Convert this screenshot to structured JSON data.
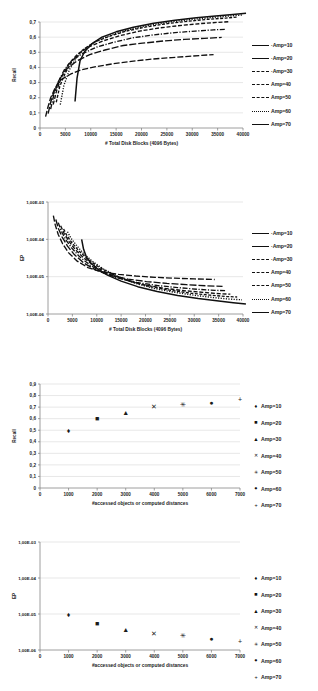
{
  "chart_data": [
    {
      "id": "recall-vs-blocks",
      "type": "line",
      "title": "",
      "xlabel": "# Total Disk Blocks (4096 Bytes)",
      "ylabel": "Recall",
      "xlim": [
        0,
        40000
      ],
      "ylim": [
        0,
        0.7
      ],
      "xticks": [
        0,
        5000,
        10000,
        15000,
        20000,
        25000,
        30000,
        35000,
        40000
      ],
      "xticklabels": [
        "0",
        "5000",
        "10000",
        "15000",
        "20000",
        "25000",
        "30000",
        "35000",
        "40000"
      ],
      "yticks": [
        0,
        0.1,
        0.2,
        0.3,
        0.4,
        0.5,
        0.6,
        0.7
      ],
      "yticklabels": [
        "0",
        "0,1",
        "0,2",
        "0,3",
        "0,4",
        "0,5",
        "0,6",
        "0,7"
      ],
      "grid": true,
      "legend_position": "right",
      "series": [
        {
          "name": "Amp=10",
          "dash": "6,2",
          "x": [
            1100,
            1500,
            2100,
            3000,
            4200,
            6000,
            8200,
            11000,
            14500,
            18000,
            22000,
            26000,
            30000,
            34200
          ],
          "y": [
            0.075,
            0.13,
            0.2,
            0.265,
            0.32,
            0.355,
            0.385,
            0.405,
            0.425,
            0.44,
            0.455,
            0.465,
            0.475,
            0.485
          ]
        },
        {
          "name": "Amp=20",
          "dash": "7,2",
          "x": [
            1600,
            2100,
            2900,
            4000,
            5400,
            7400,
            9800,
            12800,
            16400,
            20200,
            24400,
            28400,
            32400,
            35800
          ],
          "y": [
            0.095,
            0.17,
            0.255,
            0.33,
            0.395,
            0.445,
            0.485,
            0.515,
            0.545,
            0.56,
            0.575,
            0.585,
            0.592,
            0.598
          ]
        },
        {
          "name": "Amp=30",
          "dash": "5,1.6,1.2,1.6",
          "x": [
            2100,
            2700,
            3600,
            4800,
            6400,
            8600,
            11200,
            14400,
            18200,
            22400,
            26600,
            30600,
            34200,
            36600
          ],
          "y": [
            0.125,
            0.215,
            0.305,
            0.385,
            0.45,
            0.495,
            0.535,
            0.565,
            0.595,
            0.615,
            0.63,
            0.64,
            0.648,
            0.652
          ]
        },
        {
          "name": "Amp=40",
          "dash": "4,1.8",
          "x": [
            2600,
            3300,
            4300,
            5600,
            7300,
            9600,
            12400,
            15800,
            19600,
            23800,
            28000,
            31800,
            35200,
            37400
          ],
          "y": [
            0.155,
            0.25,
            0.34,
            0.42,
            0.485,
            0.535,
            0.575,
            0.61,
            0.64,
            0.662,
            0.678,
            0.69,
            0.698,
            0.702
          ]
        },
        {
          "name": "Amp=50",
          "dash": "3,1.5",
          "x": [
            3200,
            3900,
            5000,
            6400,
            8200,
            10600,
            13600,
            17000,
            21000,
            25200,
            29400,
            33200,
            36600,
            38800
          ],
          "y": [
            0.17,
            0.275,
            0.365,
            0.445,
            0.51,
            0.565,
            0.605,
            0.64,
            0.668,
            0.69,
            0.706,
            0.718,
            0.726,
            0.732
          ]
        },
        {
          "name": "Amp=60",
          "dash": "1.2,1.4",
          "x": [
            4000,
            4700,
            5800,
            7200,
            9000,
            11400,
            14400,
            17800,
            21800,
            26000,
            30200,
            34000,
            37400,
            39800
          ],
          "y": [
            0.155,
            0.28,
            0.385,
            0.465,
            0.53,
            0.58,
            0.62,
            0.652,
            0.68,
            0.702,
            0.718,
            0.73,
            0.74,
            0.746
          ]
        },
        {
          "name": "Amp=70",
          "dash": "none",
          "x": [
            6900,
            7300,
            7900,
            8800,
            10200,
            12200,
            15000,
            18400,
            22400,
            26600,
            30800,
            34600,
            38000,
            40600
          ],
          "y": [
            0.175,
            0.33,
            0.445,
            0.505,
            0.555,
            0.6,
            0.635,
            0.665,
            0.692,
            0.712,
            0.728,
            0.74,
            0.75,
            0.758
          ]
        }
      ]
    },
    {
      "id": "ep-vs-blocks",
      "type": "line",
      "title": "",
      "xlabel": "# Total Disk Blocks (4096 Bytes)",
      "ylabel": "EP",
      "xlim": [
        0,
        40000
      ],
      "ylim": [
        1e-06,
        0.001
      ],
      "yscale": "log",
      "xticks": [
        0,
        5000,
        10000,
        15000,
        20000,
        25000,
        30000,
        35000,
        40000
      ],
      "xticklabels": [
        "0",
        "5000",
        "10000",
        "15000",
        "20000",
        "25000",
        "30000",
        "35000",
        "40000"
      ],
      "yticks": [
        1e-06,
        1e-05,
        0.0001,
        0.001
      ],
      "yticklabels": [
        "1,00E-06",
        "1,00E-05",
        "1,00E-04",
        "1,00E-03"
      ],
      "grid": true,
      "legend_position": "right",
      "series": [
        {
          "name": "Amp=10",
          "dash": "6,2",
          "x": [
            1100,
            1500,
            2100,
            3000,
            4200,
            6000,
            8200,
            11000,
            14500,
            18000,
            22000,
            26000,
            30000,
            34200
          ],
          "y": [
            0.00043,
            0.00024,
            0.000135,
            7.6e-05,
            4.4e-05,
            2.6e-05,
            1.75e-05,
            1.35e-05,
            1.15e-05,
            1.04e-05,
            9.6e-06,
            9.1e-06,
            8.7e-06,
            8.4e-06
          ]
        },
        {
          "name": "Amp=20",
          "dash": "7,2",
          "x": [
            1600,
            2100,
            2900,
            4000,
            5400,
            7400,
            9800,
            12800,
            16400,
            20200,
            24400,
            28400,
            32400,
            35800
          ],
          "y": [
            0.00034,
            0.0002,
            0.000115,
            6.6e-05,
            3.9e-05,
            2.3e-05,
            1.5e-05,
            1.08e-05,
            8.6e-06,
            7.4e-06,
            6.6e-06,
            6.1e-06,
            5.7e-06,
            5.5e-06
          ]
        },
        {
          "name": "Amp=30",
          "dash": "5,1.6,1.2,1.6",
          "x": [
            2100,
            2700,
            3600,
            4800,
            6400,
            8600,
            11200,
            14400,
            18200,
            22400,
            26600,
            30600,
            34200,
            36600
          ],
          "y": [
            0.00028,
            0.00017,
            0.0001,
            6e-05,
            3.5e-05,
            2.05e-05,
            1.3e-05,
            9.1e-06,
            7e-06,
            5.8e-06,
            5.1e-06,
            4.6e-06,
            4.3e-06,
            4.2e-06
          ]
        },
        {
          "name": "Amp=40",
          "dash": "4,1.8",
          "x": [
            2600,
            3300,
            4300,
            5600,
            7300,
            9600,
            12400,
            15800,
            19600,
            23800,
            28000,
            31800,
            35200,
            37400
          ],
          "y": [
            0.00023,
            0.000145,
            8.8e-05,
            5.3e-05,
            3.2e-05,
            1.9e-05,
            1.2e-05,
            8.2e-06,
            6.1e-06,
            4.9e-06,
            4.2e-06,
            3.8e-06,
            3.5e-06,
            3.4e-06
          ]
        },
        {
          "name": "Amp=50",
          "dash": "3,1.5",
          "x": [
            3200,
            3900,
            5000,
            6400,
            8200,
            10600,
            13600,
            17000,
            21000,
            25200,
            29400,
            33200,
            36600,
            38800
          ],
          "y": [
            0.00019,
            0.000125,
            7.8e-05,
            4.8e-05,
            2.9e-05,
            1.75e-05,
            1.1e-05,
            7.4e-06,
            5.4e-06,
            4.3e-06,
            3.6e-06,
            3.2e-06,
            2.95e-06,
            2.85e-06
          ]
        },
        {
          "name": "Amp=60",
          "dash": "1.2,1.4",
          "x": [
            4000,
            4700,
            5800,
            7200,
            9000,
            11400,
            14400,
            17800,
            21800,
            26000,
            30200,
            34000,
            37400,
            39800
          ],
          "y": [
            0.00016,
            0.000108,
            7e-05,
            4.3e-05,
            2.65e-05,
            1.6e-05,
            1e-05,
            6.7e-06,
            4.8e-06,
            3.8e-06,
            3.15e-06,
            2.75e-06,
            2.5e-06,
            2.4e-06
          ]
        },
        {
          "name": "Amp=70",
          "dash": "none",
          "x": [
            6900,
            7300,
            7900,
            8800,
            10200,
            12200,
            15000,
            18400,
            22400,
            26600,
            30800,
            34600,
            38000,
            40600
          ],
          "y": [
            0.0001,
            5.4e-05,
            3.3e-05,
            2.3e-05,
            1.6e-05,
            1.1e-05,
            7.6e-06,
            5.4e-06,
            4e-06,
            3.15e-06,
            2.6e-06,
            2.25e-06,
            2e-06,
            1.85e-06
          ]
        }
      ]
    },
    {
      "id": "recall-vs-accessed",
      "type": "scatter",
      "title": "",
      "xlabel": "#accessed objects or computed distances",
      "ylabel": "Recall",
      "xlim": [
        0,
        7000
      ],
      "ylim": [
        0,
        0.9
      ],
      "xticks": [
        0,
        1000,
        2000,
        3000,
        4000,
        5000,
        6000,
        7000
      ],
      "xticklabels": [
        "0",
        "1000",
        "2000",
        "3000",
        "4000",
        "5000",
        "6000",
        "7000"
      ],
      "yticks": [
        0,
        0.1,
        0.2,
        0.3,
        0.4,
        0.5,
        0.6,
        0.7,
        0.8,
        0.9
      ],
      "yticklabels": [
        "0",
        "0,1",
        "0,2",
        "0,3",
        "0,4",
        "0,5",
        "0,6",
        "0,7",
        "0,8",
        "0,9"
      ],
      "grid": true,
      "legend_position": "right",
      "points": [
        {
          "name": "Amp=10",
          "marker": "diamond",
          "glyph": "♦",
          "x": 1000,
          "y": 0.495
        },
        {
          "name": "Amp=20",
          "marker": "square",
          "glyph": "■",
          "x": 2000,
          "y": 0.6
        },
        {
          "name": "Amp=30",
          "marker": "triangle",
          "glyph": "▲",
          "x": 3000,
          "y": 0.655
        },
        {
          "name": "Amp=40",
          "marker": "cross-x",
          "glyph": "✕",
          "x": 4000,
          "y": 0.705
        },
        {
          "name": "Amp=50",
          "marker": "star-x",
          "glyph": "✳",
          "x": 5000,
          "y": 0.722
        },
        {
          "name": "Amp=60",
          "marker": "circle",
          "glyph": "●",
          "x": 6000,
          "y": 0.742
        },
        {
          "name": "Amp=70",
          "marker": "plus",
          "glyph": "+",
          "x": 7000,
          "y": 0.762
        }
      ]
    },
    {
      "id": "ep-vs-accessed",
      "type": "scatter",
      "title": "",
      "xlabel": "#accessed objects or computed distances",
      "ylabel": "EP",
      "xlim": [
        0,
        7000
      ],
      "ylim": [
        1e-06,
        0.001
      ],
      "yscale": "log",
      "xticks": [
        0,
        1000,
        2000,
        3000,
        4000,
        5000,
        6000,
        7000
      ],
      "xticklabels": [
        "0",
        "1000",
        "2000",
        "3000",
        "4000",
        "5000",
        "6000",
        "7000"
      ],
      "yticks": [
        1e-06,
        1e-05,
        0.0001,
        0.001
      ],
      "yticklabels": [
        "1,00E-06",
        "1,00E-05",
        "1,00E-04",
        "1,00E-03"
      ],
      "grid": true,
      "legend_position": "right",
      "points": [
        {
          "name": "Amp=10",
          "marker": "diamond",
          "glyph": "♦",
          "x": 1000,
          "y": 9.5e-06
        },
        {
          "name": "Amp=20",
          "marker": "square",
          "glyph": "■",
          "x": 2000,
          "y": 5.4e-06
        },
        {
          "name": "Amp=30",
          "marker": "triangle",
          "glyph": "▲",
          "x": 3000,
          "y": 3.6e-06
        },
        {
          "name": "Amp=40",
          "marker": "cross-x",
          "glyph": "✕",
          "x": 4000,
          "y": 2.9e-06
        },
        {
          "name": "Amp=50",
          "marker": "star-x",
          "glyph": "✳",
          "x": 5000,
          "y": 2.5e-06
        },
        {
          "name": "Amp=60",
          "marker": "circle",
          "glyph": "●",
          "x": 6000,
          "y": 2e-06
        },
        {
          "name": "Amp=70",
          "marker": "plus",
          "glyph": "+",
          "x": 7000,
          "y": 1.7e-06
        }
      ]
    }
  ],
  "colors": {
    "line": "#101010",
    "grid": "#d7d7d7",
    "axis": "#868686",
    "text": "#1b1b1b"
  }
}
